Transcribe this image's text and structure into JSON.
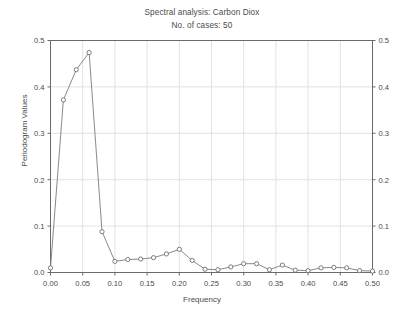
{
  "chart_data": {
    "type": "line",
    "title": "Spectral analysis: Carbon Diox",
    "subtitle": "No. of cases: 50",
    "xlabel": "Frequency",
    "ylabel": "Periodogram Values",
    "xlim": [
      0.0,
      0.5
    ],
    "ylim": [
      0.0,
      0.5
    ],
    "xticks": [
      "0.00",
      "0.05",
      "0.10",
      "0.15",
      "0.20",
      "0.25",
      "0.30",
      "0.35",
      "0.40",
      "0.45",
      "0.50"
    ],
    "xtick_values": [
      0.0,
      0.05,
      0.1,
      0.15,
      0.2,
      0.25,
      0.3,
      0.35,
      0.4,
      0.45,
      0.5
    ],
    "yticks": [
      "0.0",
      "0.1",
      "0.2",
      "0.3",
      "0.4",
      "0.5"
    ],
    "ytick_values": [
      0.0,
      0.1,
      0.2,
      0.3,
      0.4,
      0.5
    ],
    "yticks_right": [
      "0.0",
      "0.1",
      "0.2",
      "0.3",
      "0.4",
      "0.5"
    ],
    "grid": true,
    "legend": "none",
    "marker": "circle",
    "line_color": "#7c7c7c",
    "marker_color": "#6e6e6e",
    "grid_color": "#e2e2e2",
    "axis_color": "#6a6a6a",
    "series": [
      {
        "name": "Periodogram",
        "x": [
          0.0,
          0.02,
          0.04,
          0.06,
          0.08,
          0.1,
          0.12,
          0.14,
          0.16,
          0.18,
          0.2,
          0.22,
          0.24,
          0.26,
          0.28,
          0.3,
          0.32,
          0.34,
          0.36,
          0.38,
          0.4,
          0.42,
          0.44,
          0.46,
          0.48,
          0.5
        ],
        "values": [
          0.01,
          0.372,
          0.437,
          0.474,
          0.088,
          0.024,
          0.028,
          0.029,
          0.032,
          0.04,
          0.05,
          0.026,
          0.007,
          0.006,
          0.012,
          0.019,
          0.019,
          0.006,
          0.016,
          0.005,
          0.004,
          0.01,
          0.011,
          0.01,
          0.004,
          0.003
        ]
      }
    ]
  }
}
